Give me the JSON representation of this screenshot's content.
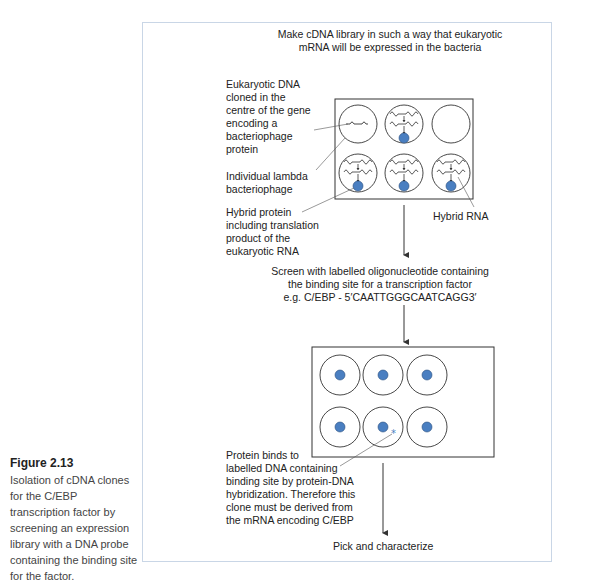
{
  "caption": {
    "title": "Figure 2.13",
    "text": "Isolation of cDNA clones for the C/EBP transcription factor by screening an expression library with a DNA probe containing the binding site for the factor."
  },
  "diagram": {
    "step1": {
      "line1": "Make cDNA library in such a way that eukaryotic",
      "line2": "mRNA will be expressed in the bacteria"
    },
    "labels": {
      "eukaryotic_dna": [
        "Eukaryotic DNA",
        "cloned in the",
        "centre of the gene",
        "encoding a",
        "bacteriophage",
        "protein"
      ],
      "lambda": [
        "Individual lambda",
        "bacteriophage"
      ],
      "hybrid_protein": [
        "Hybrid protein",
        "including translation",
        "product of the",
        "eukaryotic RNA"
      ],
      "hybrid_rna": "Hybrid RNA"
    },
    "step2": {
      "line1": "Screen with labelled oligonucleotide containing",
      "line2": "the binding site for a transcription factor",
      "line3": "e.g. C/EBP - 5′CAATTGGGCAATCAGG3′"
    },
    "binding_note": [
      "Protein binds to",
      "labelled DNA containing",
      "binding site by protein-DNA",
      "hybridization. Therefore this",
      "clone must be derived from",
      "the mRNA encoding C/EBP"
    ],
    "step3": "Pick and characterize",
    "colors": {
      "protein_blue": "#4a7fc1",
      "panel_border": "#c9d6e6",
      "line": "#333333"
    }
  }
}
